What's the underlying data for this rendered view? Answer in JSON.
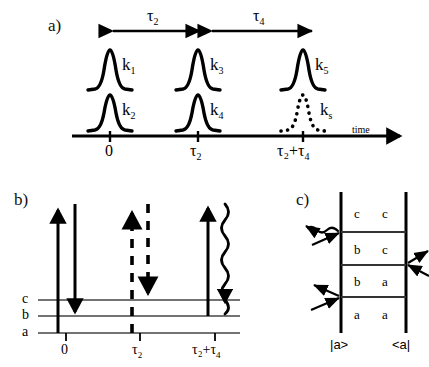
{
  "figure": {
    "panels": [
      {
        "id": "a",
        "label": "a)"
      },
      {
        "id": "b",
        "label": "b)"
      },
      {
        "id": "c",
        "label": "c)"
      }
    ]
  },
  "panel_a": {
    "label": "a)",
    "interval_labels": [
      {
        "name": "tau2",
        "base": "τ",
        "sub": "2"
      },
      {
        "name": "tau4",
        "base": "τ",
        "sub": "4"
      }
    ],
    "pulses": [
      {
        "name": "k1",
        "base": "k",
        "sub": "1",
        "style": "solid",
        "row": "upper",
        "position": "0"
      },
      {
        "name": "k2",
        "base": "k",
        "sub": "2",
        "style": "solid",
        "row": "lower",
        "position": "0"
      },
      {
        "name": "k3",
        "base": "k",
        "sub": "3",
        "style": "solid",
        "row": "upper",
        "position": "tau2"
      },
      {
        "name": "k4",
        "base": "k",
        "sub": "4",
        "style": "solid",
        "row": "lower",
        "position": "tau2"
      },
      {
        "name": "k5",
        "base": "k",
        "sub": "5",
        "style": "solid",
        "row": "upper",
        "position": "tau2+tau4"
      },
      {
        "name": "ks",
        "base": "k",
        "sub": "s",
        "style": "dotted",
        "row": "lower",
        "position": "tau2+tau4"
      }
    ],
    "axis": {
      "name": "time-axis",
      "axis_title": "time",
      "ticks": [
        {
          "base": "0",
          "sub": ""
        },
        {
          "base": "τ",
          "sub": "2"
        },
        {
          "base": "τ₂+τ",
          "sub": "4"
        }
      ]
    }
  },
  "panel_b": {
    "label": "b)",
    "levels": [
      {
        "name": "level-c",
        "label": "c"
      },
      {
        "name": "level-b",
        "label": "b"
      },
      {
        "name": "level-a",
        "label": "a"
      }
    ],
    "ticks": [
      {
        "base": "0",
        "sub": ""
      },
      {
        "base": "τ",
        "sub": "2"
      },
      {
        "base": "τ₂+τ",
        "sub": "4"
      }
    ],
    "transitions": [
      {
        "name": "arrow-up-1",
        "style": "solid",
        "direction": "up",
        "time": "0"
      },
      {
        "name": "arrow-down-1",
        "style": "solid",
        "direction": "down",
        "time": "0"
      },
      {
        "name": "arrow-up-2",
        "style": "dashed",
        "direction": "up",
        "time": "tau2"
      },
      {
        "name": "arrow-down-2",
        "style": "dashed",
        "direction": "down",
        "time": "tau2"
      },
      {
        "name": "arrow-up-3",
        "style": "solid",
        "direction": "up",
        "time": "tau2+tau4"
      },
      {
        "name": "arrow-emission",
        "style": "wavy",
        "direction": "down",
        "time": "tau2+tau4"
      }
    ]
  },
  "panel_c": {
    "label": "c)",
    "rows": [
      {
        "name": "row-cc",
        "ket": "c",
        "bra": "c"
      },
      {
        "name": "row-bc",
        "ket": "b",
        "bra": "c"
      },
      {
        "name": "row-ba",
        "ket": "b",
        "bra": "a"
      },
      {
        "name": "row-aa",
        "ket": "a",
        "bra": "a"
      }
    ],
    "ket_label": "|a>",
    "bra_label": "<a|",
    "interactions": [
      {
        "name": "interaction-in-bottom-left",
        "side": "left",
        "direction": "incoming",
        "style": "straight"
      },
      {
        "name": "interaction-out-bottom-left",
        "side": "left",
        "direction": "outgoing",
        "style": "straight"
      },
      {
        "name": "interaction-in-right",
        "side": "right",
        "direction": "incoming",
        "style": "straight"
      },
      {
        "name": "interaction-out-right",
        "side": "right",
        "direction": "outgoing",
        "style": "straight"
      },
      {
        "name": "interaction-in-top-left",
        "side": "left",
        "direction": "incoming",
        "style": "straight"
      },
      {
        "name": "interaction-emission-wavy",
        "side": "left",
        "direction": "outgoing",
        "style": "wavy"
      }
    ]
  },
  "colors": {
    "ink": "#000000",
    "background": "#ffffff",
    "rule": "#555555"
  }
}
